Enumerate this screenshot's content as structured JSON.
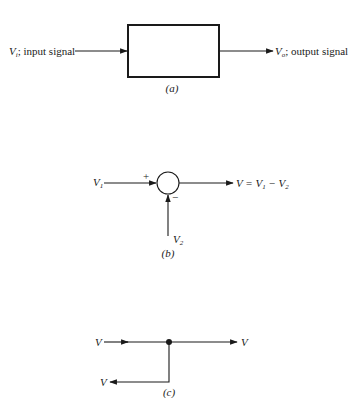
{
  "panel_a": {
    "input_symbol": "V",
    "input_subscript": "i",
    "input_text": "; input signal",
    "output_symbol": "V",
    "output_subscript": "o",
    "output_text": "; output signal",
    "caption": "(a)"
  },
  "panel_b": {
    "input1_symbol": "V",
    "input1_subscript": "1",
    "plus_sign": "+",
    "minus_sign": "−",
    "input2_symbol": "V",
    "input2_subscript": "2",
    "output_equation": {
      "lhs": "V = V",
      "sub1": "1",
      "mid": " − V",
      "sub2": "2"
    },
    "caption": "(b)"
  },
  "panel_c": {
    "input_label": "V",
    "output_right_label": "V",
    "output_branch_label": "V",
    "caption": "(c)"
  },
  "colors": {
    "ink": "#1a1a1a",
    "background": "#ffffff"
  }
}
